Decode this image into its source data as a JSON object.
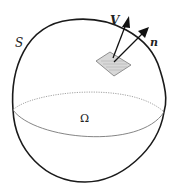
{
  "figure": {
    "surface_label": "S",
    "region_label": "Ω",
    "velocity_label": "V",
    "normal_label": "n",
    "colors": {
      "outline": "#1a1a1a",
      "equator": "#888888",
      "patch_fill": "#d8d8d8",
      "patch_stroke": "#777777"
    }
  }
}
